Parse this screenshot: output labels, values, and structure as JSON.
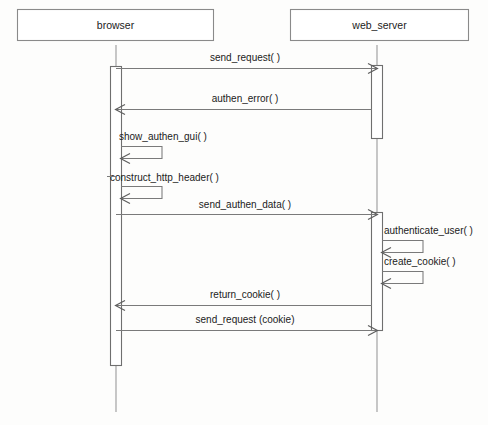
{
  "diagram": {
    "type": "uml-sequence-diagram",
    "background_color": "#fdfdfc",
    "line_color": "#7a7a7a",
    "text_color": "#1b1b1b",
    "participants": [
      {
        "id": "browser",
        "label": "browser"
      },
      {
        "id": "web_server",
        "label": "web_server"
      }
    ],
    "messages": [
      {
        "id": "m1",
        "label": "send_request( )",
        "from": "browser",
        "to": "web_server",
        "kind": "call"
      },
      {
        "id": "m2",
        "label": "authen_error( )",
        "from": "web_server",
        "to": "browser",
        "kind": "return"
      },
      {
        "id": "m3",
        "label": "show_authen_gui( )",
        "from": "browser",
        "to": "browser",
        "kind": "self"
      },
      {
        "id": "m4",
        "label": "construct_http_header( )",
        "from": "browser",
        "to": "browser",
        "kind": "self"
      },
      {
        "id": "m5",
        "label": "send_authen_data( )",
        "from": "browser",
        "to": "web_server",
        "kind": "call"
      },
      {
        "id": "m6",
        "label": "authenticate_user( )",
        "from": "web_server",
        "to": "web_server",
        "kind": "self"
      },
      {
        "id": "m7",
        "label": "create_cookie( )",
        "from": "web_server",
        "to": "web_server",
        "kind": "self"
      },
      {
        "id": "m8",
        "label": "return_cookie( )",
        "from": "web_server",
        "to": "browser",
        "kind": "return"
      },
      {
        "id": "m9",
        "label": "send_request (cookie)",
        "from": "browser",
        "to": "web_server",
        "kind": "call"
      }
    ]
  }
}
